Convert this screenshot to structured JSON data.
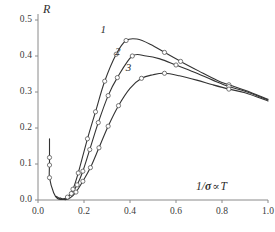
{
  "chart_data": {
    "type": "line",
    "title": "",
    "xlabel": "1/σ ∝ T",
    "ylabel": "R",
    "xlim": [
      0.0,
      1.0
    ],
    "ylim": [
      0.0,
      0.5
    ],
    "grid": false,
    "legend_position": "inline-curve-labels",
    "xticks": [
      "0.0",
      "0.2",
      "0.4",
      "0.6",
      "0.8",
      "1.0"
    ],
    "xtick_values": [
      0.0,
      0.2,
      0.4,
      0.6,
      0.8,
      1.0
    ],
    "yticks": [
      "0.0",
      "0.1",
      "0.2",
      "0.3",
      "0.4",
      "0.5"
    ],
    "ytick_values": [
      0.0,
      0.1,
      0.2,
      0.3,
      0.4,
      0.5
    ],
    "marker": "open-circle",
    "series": [
      {
        "name": "1",
        "label": "1",
        "color": "#333333",
        "x": [
          0.05,
          0.05,
          0.05,
          0.05,
          0.068,
          0.085,
          0.105,
          0.128,
          0.152,
          0.175,
          0.215,
          0.25,
          0.29,
          0.34,
          0.383,
          0.43,
          0.49,
          0.55,
          0.62,
          0.7,
          0.78,
          0.83,
          0.9,
          1.0
        ],
        "y": [
          0.17,
          0.118,
          0.097,
          0.062,
          0.02,
          0.004,
          0.002,
          0.008,
          0.03,
          0.075,
          0.17,
          0.245,
          0.33,
          0.405,
          0.443,
          0.447,
          0.432,
          0.41,
          0.385,
          0.358,
          0.332,
          0.32,
          0.305,
          0.28
        ]
      },
      {
        "name": "2",
        "label": "2",
        "color": "#333333",
        "x": [
          0.08,
          0.1,
          0.12,
          0.145,
          0.17,
          0.195,
          0.225,
          0.262,
          0.305,
          0.345,
          0.41,
          0.47,
          0.53,
          0.6,
          0.68,
          0.76,
          0.83,
          0.9,
          1.0
        ],
        "y": [
          0.01,
          0.002,
          0.004,
          0.018,
          0.042,
          0.08,
          0.14,
          0.215,
          0.29,
          0.34,
          0.4,
          0.4,
          0.392,
          0.375,
          0.355,
          0.333,
          0.315,
          0.302,
          0.278
        ]
      },
      {
        "name": "3",
        "label": "3",
        "color": "#333333",
        "x": [
          0.095,
          0.118,
          0.14,
          0.165,
          0.195,
          0.228,
          0.265,
          0.305,
          0.35,
          0.4,
          0.45,
          0.5,
          0.55,
          0.615,
          0.69,
          0.76,
          0.83,
          0.9,
          1.0
        ],
        "y": [
          0.006,
          0.001,
          0.006,
          0.022,
          0.052,
          0.09,
          0.145,
          0.205,
          0.262,
          0.31,
          0.338,
          0.348,
          0.352,
          0.345,
          0.333,
          0.32,
          0.308,
          0.298,
          0.275
        ]
      }
    ],
    "curve_label_positions": [
      {
        "label": "1",
        "x": 0.285,
        "y": 0.472
      },
      {
        "label": "2",
        "x": 0.348,
        "y": 0.412
      },
      {
        "label": "3",
        "x": 0.395,
        "y": 0.368
      }
    ],
    "markers": {
      "series_1": [
        {
          "x": 0.05,
          "y": 0.118
        },
        {
          "x": 0.05,
          "y": 0.097
        },
        {
          "x": 0.05,
          "y": 0.062
        },
        {
          "x": 0.128,
          "y": 0.008
        },
        {
          "x": 0.152,
          "y": 0.03
        },
        {
          "x": 0.175,
          "y": 0.075
        },
        {
          "x": 0.215,
          "y": 0.17
        },
        {
          "x": 0.25,
          "y": 0.245
        },
        {
          "x": 0.29,
          "y": 0.33
        },
        {
          "x": 0.34,
          "y": 0.405
        },
        {
          "x": 0.383,
          "y": 0.443
        },
        {
          "x": 0.55,
          "y": 0.41
        },
        {
          "x": 0.62,
          "y": 0.385
        },
        {
          "x": 0.83,
          "y": 0.32
        }
      ],
      "series_2": [
        {
          "x": 0.145,
          "y": 0.018
        },
        {
          "x": 0.17,
          "y": 0.042
        },
        {
          "x": 0.195,
          "y": 0.08
        },
        {
          "x": 0.225,
          "y": 0.14
        },
        {
          "x": 0.262,
          "y": 0.215
        },
        {
          "x": 0.305,
          "y": 0.29
        },
        {
          "x": 0.345,
          "y": 0.34
        },
        {
          "x": 0.41,
          "y": 0.4
        },
        {
          "x": 0.6,
          "y": 0.375
        },
        {
          "x": 0.83,
          "y": 0.315
        }
      ],
      "series_3": [
        {
          "x": 0.165,
          "y": 0.022
        },
        {
          "x": 0.195,
          "y": 0.052
        },
        {
          "x": 0.228,
          "y": 0.09
        },
        {
          "x": 0.265,
          "y": 0.145
        },
        {
          "x": 0.305,
          "y": 0.205
        },
        {
          "x": 0.35,
          "y": 0.262
        },
        {
          "x": 0.45,
          "y": 0.338
        },
        {
          "x": 0.55,
          "y": 0.352
        },
        {
          "x": 0.83,
          "y": 0.308
        }
      ]
    },
    "axis_color": "#8a8a8a",
    "curve_color": "#333333",
    "marker_fill": "#ffffff",
    "text_color": "#3a3a3a"
  }
}
